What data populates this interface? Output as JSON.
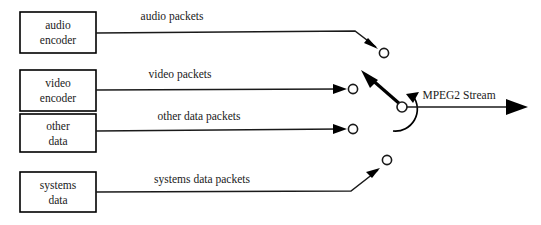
{
  "diagram": {
    "stroke_color": "#1a1a1a",
    "background_color": "#ffffff",
    "sources": [
      {
        "id": "audio-encoder",
        "line1": "audio",
        "line2": "encoder",
        "edge_label": "audio packets"
      },
      {
        "id": "video-encoder",
        "line1": "video",
        "line2": "encoder",
        "edge_label": "video packets"
      },
      {
        "id": "other-data",
        "line1": "other",
        "line2": "data",
        "edge_label": "other data packets"
      },
      {
        "id": "systems-data",
        "line1": "systems",
        "line2": "data",
        "edge_label": "systems data packets"
      }
    ],
    "output": {
      "label": "MPEG2 Stream"
    },
    "switch": {
      "selected_contact": "video-encoder",
      "rotation_direction": "clockwise"
    }
  }
}
